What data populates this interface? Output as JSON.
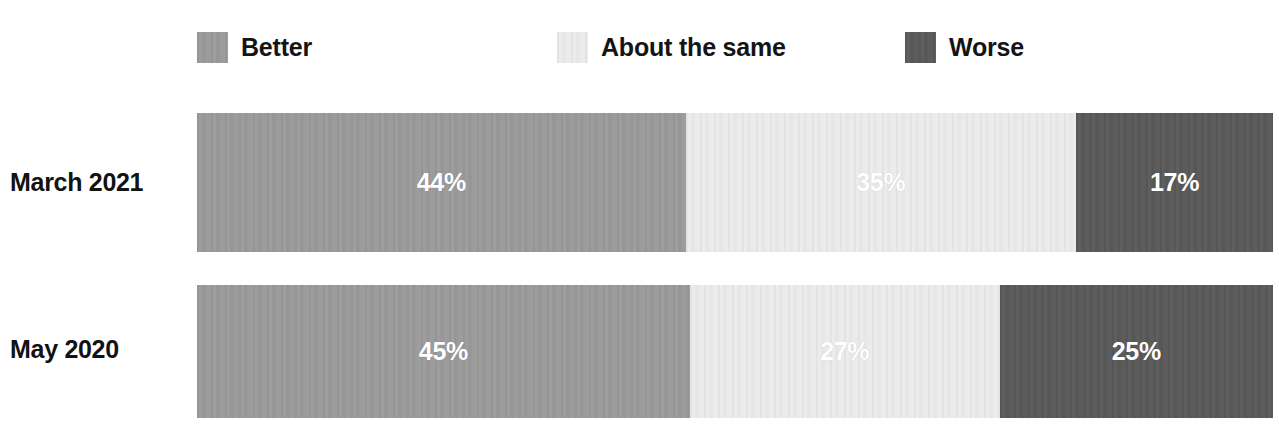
{
  "chart_data": {
    "type": "bar",
    "subtype": "100% stacked horizontal bar",
    "title": "",
    "subtitle": "",
    "xlabel": "",
    "ylabel": "",
    "categories": [
      "March 2021",
      "May 2020"
    ],
    "series": [
      {
        "name": "Better",
        "values": [
          44,
          45
        ],
        "color": "#9a9a9a"
      },
      {
        "name": "About the same",
        "values": [
          35,
          27
        ],
        "color": "#ebebeb"
      },
      {
        "name": "Worse",
        "values": [
          17,
          25
        ],
        "color": "#595959"
      }
    ],
    "value_labels": [
      [
        "44%",
        "35%",
        "17%"
      ],
      [
        "45%",
        "27%",
        "25%"
      ]
    ],
    "xlim": [
      0,
      100
    ],
    "grid": false,
    "legend_position": "top"
  },
  "legend": {
    "items": [
      {
        "label": "Better",
        "color": "#9a9a9a"
      },
      {
        "label": "About the same",
        "color": "#ebebeb"
      },
      {
        "label": "Worse",
        "color": "#595959"
      }
    ]
  },
  "rows": [
    {
      "label": "March 2021",
      "segments": [
        {
          "name": "Better",
          "value": "44%",
          "color": "#9a9a9a",
          "width_pct": 45.4
        },
        {
          "name": "About the same",
          "value": "35%",
          "color": "#ebebeb",
          "width_pct": 36.3
        },
        {
          "name": "Worse",
          "value": "17%",
          "color": "#595959",
          "width_pct": 18.3
        }
      ]
    },
    {
      "label": "May 2020",
      "segments": [
        {
          "name": "Better",
          "value": "45%",
          "color": "#9a9a9a",
          "width_pct": 45.8
        },
        {
          "name": "About the same",
          "value": "27%",
          "color": "#ebebeb",
          "width_pct": 28.8
        },
        {
          "name": "Worse",
          "value": "25%",
          "color": "#595959",
          "width_pct": 25.4
        }
      ]
    }
  ]
}
